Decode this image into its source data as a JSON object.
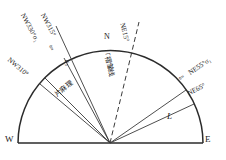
{
  "figure": {
    "type": "rose-diagram",
    "background": "#ffffff",
    "stroke_color": "#2b2b2b",
    "text_color": "#1a1a1a",
    "center": {
      "x": 110,
      "y": 143
    },
    "radius": 92,
    "baseline": {
      "x1": 18,
      "y1": 143,
      "x2": 203,
      "y2": 143
    }
  },
  "cardinal": {
    "west": "W",
    "east": "E",
    "north": "N"
  },
  "rays": [
    {
      "id": "nw330",
      "azimuth": 330,
      "style": "solid",
      "label": "NW330°σ₁",
      "has_arrow": true
    },
    {
      "id": "nw315",
      "azimuth": 315,
      "style": "solid",
      "label": "NW315°",
      "has_arrow": false
    },
    {
      "id": "nw310",
      "azimuth": 310,
      "style": "solid",
      "label": "NW310°",
      "has_arrow": false
    },
    {
      "id": "ne15",
      "azimuth": 15,
      "style": "dashed",
      "label": "NE15°",
      "has_arrow": false
    },
    {
      "id": "ne55",
      "azimuth": 55,
      "style": "solid",
      "label": "NE55°σ₁",
      "has_arrow": true
    },
    {
      "id": "ne65",
      "azimuth": 65,
      "style": "solid",
      "label": "NE65°",
      "has_arrow": false
    }
  ],
  "annotations": {
    "fold_axis": "「褶皱线",
    "gneissic_foliation": "片麻理",
    "sigma_small": "σ₃",
    "lineation": "L",
    "arrow_glyph": "⇦"
  }
}
